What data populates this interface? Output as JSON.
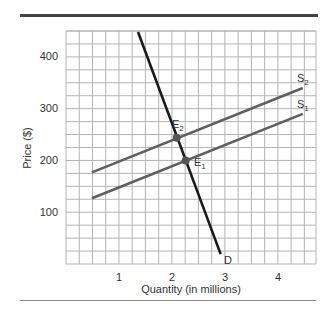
{
  "chart_data": {
    "type": "line",
    "title": "",
    "xlabel": "Quantity (in millions)",
    "ylabel": "Price ($)",
    "xlim": [
      0,
      4.72
    ],
    "ylim": [
      0,
      450
    ],
    "x_ticks": [
      1,
      2,
      3,
      4
    ],
    "y_ticks": [
      100,
      200,
      300,
      400
    ],
    "x_tick_labels": [
      "1",
      "2",
      "3",
      "4"
    ],
    "y_tick_labels": [
      "100",
      "200",
      "300",
      "400"
    ],
    "grid": true,
    "grid_step": {
      "x": 0.25,
      "y": 25
    },
    "legend": "none (curves labeled inline)",
    "series": [
      {
        "name": "D",
        "label": "D",
        "color": "#1a1a1a",
        "points": [
          [
            1.36,
            448
          ],
          [
            2.92,
            19
          ]
        ]
      },
      {
        "name": "S2",
        "label": "S",
        "subscript": "2",
        "color": "#5f5f5f",
        "points": [
          [
            0.49,
            177
          ],
          [
            4.47,
            340
          ]
        ]
      },
      {
        "name": "S1",
        "label": "S",
        "subscript": "1",
        "color": "#5f5f5f",
        "points": [
          [
            0.49,
            127
          ],
          [
            4.47,
            290
          ]
        ]
      }
    ],
    "annotations": [
      {
        "name": "E2",
        "label": "E",
        "subscript": "2",
        "x": 2.09,
        "y": 244,
        "marker_color": "#555555"
      },
      {
        "name": "E1",
        "label": "E",
        "subscript": "1",
        "x": 2.26,
        "y": 200,
        "marker_color": "#555555"
      }
    ]
  },
  "axes": {
    "x_title": "Quantity (in millions)",
    "y_title": "Price ($)",
    "x_ticks": [
      "1",
      "2",
      "3",
      "4"
    ],
    "y_ticks": [
      "100",
      "200",
      "300",
      "400"
    ]
  },
  "labels": {
    "demand": "D",
    "s2_main": "S",
    "s2_sub": "2",
    "s1_main": "S",
    "s1_sub": "1",
    "e2_main": "E",
    "e2_sub": "2",
    "e1_main": "E",
    "e1_sub": "1"
  },
  "colors": {
    "grid": "#b4b4b4",
    "demand": "#1a1a1a",
    "supply": "#5f5f5f",
    "points": "#555555",
    "rule_top": "#444444",
    "rule_bottom": "#8a8a8a"
  }
}
